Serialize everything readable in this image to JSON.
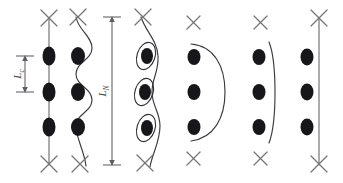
{
  "figure": {
    "name": "vortex-pinning-configurations",
    "width": 343,
    "height": 183,
    "background_color": "#ffffff",
    "panel_count": 6
  },
  "colors": {
    "pin_site_fill": "#17171a",
    "vortex_line_stroke": "#6e6e72",
    "vortex_line_dark_stroke": "#3b3b3f",
    "cross_stroke": "#76767a",
    "loop_outline_stroke": "#2e2e32",
    "dimension_stroke": "#5f5f63",
    "label_fill": "#46464a"
  },
  "labels": {
    "collective_length": {
      "text": "L",
      "subscript": "c",
      "full": "Lc",
      "orientation": "vertical-rotated",
      "panel": 1
    },
    "nucleation_length": {
      "text": "L",
      "subscript": "N",
      "full": "LN",
      "orientation": "vertical-rotated",
      "panel": 2
    }
  },
  "panels": [
    {
      "index": 1,
      "name": "straight-pinned-line",
      "description": "straight vertical vortex line threading three pinning sites",
      "line_shape": "straight",
      "pin_site_count": 3,
      "cross_markers": [
        "top",
        "bottom"
      ],
      "dimension": "Lc",
      "has_loops": false
    },
    {
      "index": 2,
      "name": "serpentine-bowed-line",
      "description": "serpentine vortex line bowing between three pinning sites",
      "line_shape": "serpentine",
      "pin_site_count": 3,
      "cross_markers": [
        "top",
        "bottom"
      ],
      "dimension": "LN",
      "has_loops": false
    },
    {
      "index": 3,
      "name": "looped-line",
      "description": "vortex line forming closed loops around each pinning site",
      "line_shape": "looped",
      "pin_site_count": 3,
      "cross_markers": [
        "top",
        "bottom"
      ],
      "dimension": null,
      "has_loops": true
    },
    {
      "index": 4,
      "name": "large-bow-depinned",
      "description": "strongly bowed arc depinned from three sites",
      "line_shape": "large-bow",
      "pin_site_count": 3,
      "cross_markers": [
        "top",
        "bottom"
      ],
      "dimension": null,
      "has_loops": false
    },
    {
      "index": 5,
      "name": "small-bow-depinned",
      "description": "gently bowed arc beside three pinning sites",
      "line_shape": "small-bow",
      "pin_site_count": 3,
      "cross_markers": [
        "top",
        "bottom"
      ],
      "dimension": null,
      "has_loops": false
    },
    {
      "index": 6,
      "name": "straight-depinned-line",
      "description": "straight vertical line with three pinning sites offset to the left",
      "line_shape": "straight",
      "pin_site_count": 3,
      "cross_markers": [
        "top",
        "bottom"
      ],
      "dimension": null,
      "has_loops": false
    }
  ]
}
